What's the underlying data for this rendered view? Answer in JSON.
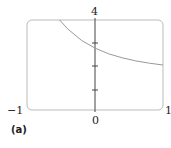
{
  "chart_data": {
    "type": "line",
    "title": "",
    "subfigure_label": "(a)",
    "xlabel": "",
    "ylabel": "",
    "xlim": [
      -1,
      1
    ],
    "ylim": [
      0,
      4
    ],
    "x_tick_labels": [
      "-1",
      "0",
      "1"
    ],
    "y_tick_labels": [
      "4"
    ],
    "y_minor_ticks": [
      1,
      2,
      3
    ],
    "grid": false,
    "series": [
      {
        "name": "curve",
        "color": "#999999",
        "x": [
          -0.52,
          -0.4,
          -0.2,
          0,
          0.2,
          0.4,
          0.6,
          0.8,
          1.0
        ],
        "y": [
          4.0,
          3.6,
          3.1,
          2.75,
          2.5,
          2.32,
          2.18,
          2.08,
          2.0
        ]
      }
    ]
  },
  "labels": {
    "xmin": "−1",
    "xzero": "0",
    "xmax": "1",
    "ymax": "4",
    "subfig": "(a)"
  }
}
